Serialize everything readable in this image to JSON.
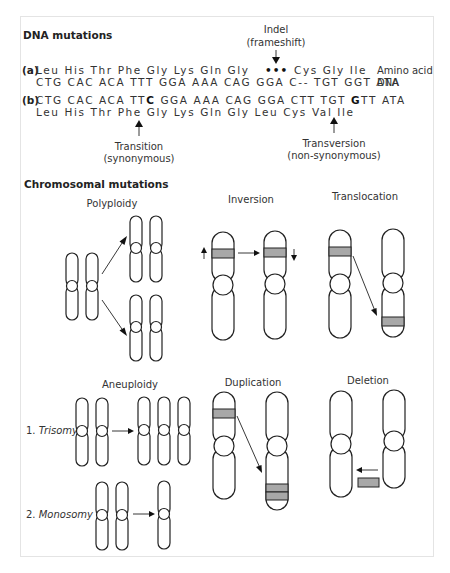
{
  "dna_section": {
    "title": "DNA mutations",
    "indel_label_line1": "Indel",
    "indel_label_line2": "(frameshift)",
    "row_a": {
      "marker": "(a)",
      "amino_acids": "Leu His Thr Phe Gly Lys Gln Gly",
      "gap_dots": "•••",
      "amino_acids_after": "Cys Gly Ile",
      "amino_label": "Amino acid",
      "dna": "CTG CAC ACA TTT GGA AAA CAG GGA C-- TGT GGT ATA",
      "dna_label": "DNA"
    },
    "row_b": {
      "marker": "(b)",
      "dna_part1": "CTG CAC ACA TT",
      "dna_bold1": "C",
      "dna_part2": " GGA AAA CAG GGA CTT TGT ",
      "dna_bold2": "G",
      "dna_part3": "TT ATA",
      "amino_acids": "Leu His Thr Phe Gly Lys Gln Gly Leu Cys Val Ile"
    },
    "transition_label_line1": "Transition",
    "transition_label_line2": "(synonymous)",
    "transversion_label_line1": "Transversion",
    "transversion_label_line2": "(non-synonymous)"
  },
  "chromosomal_section": {
    "title": "Chromosomal mutations",
    "polyploidy": "Polyploidy",
    "inversion": "Inversion",
    "translocation": "Translocation",
    "aneuploidy": "Aneuploidy",
    "trisomy_num": "1.",
    "trisomy": "Trisomy",
    "monosomy_num": "2.",
    "monosomy": "Monosomy",
    "duplication": "Duplication",
    "deletion": "Deletion"
  },
  "colors": {
    "band": "#a8a8a8",
    "outline": "#222222",
    "frame": "#e4e4e4"
  }
}
